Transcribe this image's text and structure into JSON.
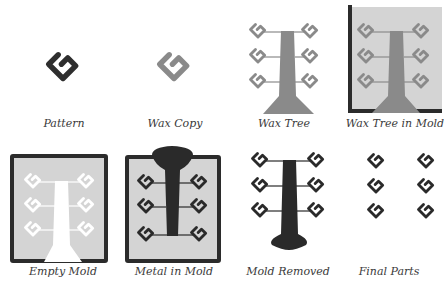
{
  "colors": {
    "pattern": "#2e2e2e",
    "wax": "#8a8a8a",
    "mold_fill": "#d4d4d4",
    "mold_frame": "#2b2b2b",
    "metal": "#2a2a2a",
    "cavity": "#ffffff"
  },
  "steps": [
    {
      "id": "pattern",
      "label": "Pattern"
    },
    {
      "id": "wax-copy",
      "label": "Wax Copy"
    },
    {
      "id": "wax-tree",
      "label": "Wax Tree"
    },
    {
      "id": "wax-tree-in-mold",
      "label": "Wax Tree in Mold"
    },
    {
      "id": "empty-mold",
      "label": "Empty Mold"
    },
    {
      "id": "metal-in-mold",
      "label": "Metal in Mold"
    },
    {
      "id": "mold-removed",
      "label": "Mold Removed"
    },
    {
      "id": "final-parts",
      "label": "Final Parts"
    }
  ]
}
